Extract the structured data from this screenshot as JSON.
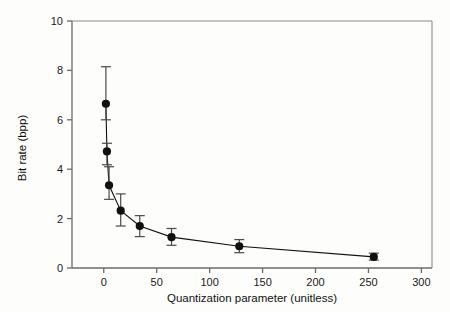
{
  "chart_data": {
    "type": "scatter",
    "title": "",
    "xlabel": "Quantization parameter (unitless)",
    "ylabel": "Bit rate (bpp)",
    "xlim": [
      -30,
      310
    ],
    "ylim": [
      0,
      10
    ],
    "xticks": [
      0,
      50,
      100,
      150,
      200,
      250,
      300
    ],
    "xtick_labels": [
      "0",
      "50",
      "100",
      "150",
      "200",
      "250",
      "300"
    ],
    "yticks": [
      0,
      2,
      4,
      6,
      8,
      10
    ],
    "ytick_labels": [
      "0",
      "2",
      "4",
      "6",
      "8",
      "10"
    ],
    "grid": false,
    "legend": null,
    "series": [
      {
        "name": "Bit rate vs quantization parameter",
        "marker": "filled-circle",
        "line": "solid",
        "color": "#111111",
        "errorbars": true,
        "points": [
          {
            "x": 2,
            "y": 6.65,
            "yerr_low": 6.0,
            "yerr_high": 8.15
          },
          {
            "x": 3,
            "y": 4.72,
            "yerr_low": 4.18,
            "yerr_high": 5.05
          },
          {
            "x": 5,
            "y": 3.35,
            "yerr_low": 2.78,
            "yerr_high": 4.1
          },
          {
            "x": 16,
            "y": 2.32,
            "yerr_low": 1.7,
            "yerr_high": 3.0
          },
          {
            "x": 34,
            "y": 1.7,
            "yerr_low": 1.27,
            "yerr_high": 2.12
          },
          {
            "x": 64,
            "y": 1.25,
            "yerr_low": 0.92,
            "yerr_high": 1.6
          },
          {
            "x": 128,
            "y": 0.88,
            "yerr_low": 0.62,
            "yerr_high": 1.15
          },
          {
            "x": 255,
            "y": 0.45,
            "yerr_low": 0.32,
            "yerr_high": 0.6
          }
        ]
      }
    ]
  },
  "axes": {
    "x_title": "Quantization parameter (unitless)",
    "y_title": "Bit rate (bpp)"
  },
  "colors": {
    "marker": "#111111",
    "line": "#1a1a1a",
    "errorbar": "#4a4a4a",
    "axis": "#6b6b6b",
    "background": "#fdfdfb"
  }
}
